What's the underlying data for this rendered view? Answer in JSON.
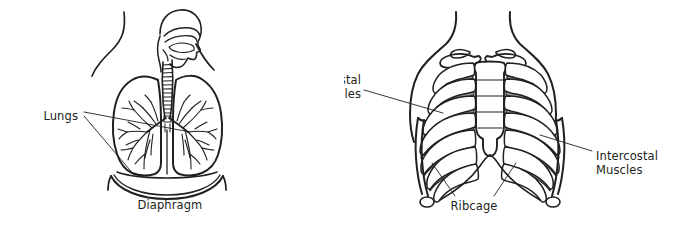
{
  "figure": {
    "title_visible": false,
    "background_color": "#ffffff",
    "ink_color": "#231f20",
    "muscle_fill_color": "#999999",
    "bone_fill_color": "#ffffff"
  },
  "panels": [
    {
      "id": "left-panel",
      "name": "lungs-and-diaphragm-diagram",
      "description": "Front view of lungs with trachea, bronchial tree and head in profile above",
      "labels": [
        {
          "id": "lungs",
          "text": "Lungs",
          "anchor": "end",
          "x": 78,
          "y": 116,
          "leader_lines": [
            {
              "points": "84,112 190,132"
            },
            {
              "points": "84,116 135,176"
            }
          ]
        },
        {
          "id": "diaphragm",
          "text": "Diaphragm",
          "anchor": "middle",
          "x": 170,
          "y": 205,
          "leader_lines": []
        }
      ]
    },
    {
      "id": "right-panel",
      "name": "ribcage-and-intercostal-muscles-diagram",
      "description": "Front view of ribcage with clavicles, sternum and shaded intercostal muscles",
      "labels": [
        {
          "id": "intercostal-muscles-left",
          "text_lines": [
            "Intercostal",
            "Muscles"
          ],
          "anchor": "end",
          "x": 361,
          "y": 80,
          "line_height": 14,
          "leader_lines": [
            {
              "points": "364,90 443,113"
            }
          ]
        },
        {
          "id": "intercostal-muscles-right",
          "text_lines": [
            "Intercostal",
            "Muscles"
          ],
          "anchor": "start",
          "x": 596,
          "y": 156,
          "line_height": 14,
          "leader_lines": [
            {
              "points": "592,151 540,135"
            }
          ]
        },
        {
          "id": "ribcage",
          "text": "Ribcage",
          "anchor": "middle",
          "x": 474,
          "y": 206,
          "leader_lines": [
            {
              "points": "455,196 432,163"
            },
            {
              "points": "494,196 516,163"
            }
          ]
        }
      ]
    }
  ],
  "label_text": {
    "lungs": "Lungs",
    "diaphragm": "Diaphragm",
    "ribcage": "Ribcage",
    "intercostal": "Intercostal",
    "muscles": "Muscles"
  }
}
